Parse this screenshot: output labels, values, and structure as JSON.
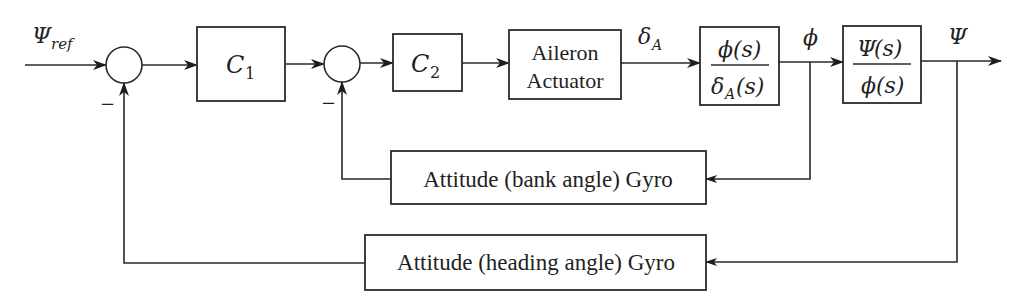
{
  "diagram": {
    "title": "",
    "input": {
      "symbol": "Ψ",
      "subscript": "ref"
    },
    "summing_junctions": [
      {
        "id": "sum1",
        "feedback_sign": "−"
      },
      {
        "id": "sum2",
        "feedback_sign": "−"
      }
    ],
    "blocks": {
      "c1": {
        "symbol": "C",
        "subscript": "1"
      },
      "c2": {
        "symbol": "C",
        "subscript": "2"
      },
      "actuator": {
        "line1": "Aileron",
        "line2": "Actuator"
      },
      "roll_tf": {
        "num_symbol": "ϕ",
        "num_arg": "(s)",
        "den_symbol": "δ",
        "den_sub": "A",
        "den_arg": "(s)"
      },
      "heading_tf": {
        "num_symbol": "Ψ",
        "num_arg": "(s)",
        "den_symbol": "ϕ",
        "den_arg": "(s)"
      },
      "bank_gyro": {
        "label": "Attitude (bank angle) Gyro"
      },
      "heading_gyro": {
        "label": "Attitude (heading angle) Gyro"
      }
    },
    "signals": {
      "aileron_deflection": {
        "symbol": "δ",
        "subscript": "A"
      },
      "bank_angle": {
        "symbol": "ϕ"
      },
      "heading": {
        "symbol": "Ψ"
      }
    },
    "colors": {
      "stroke": "#2a2a2a",
      "text": "#1f1f1f",
      "background": "#ffffff"
    }
  }
}
